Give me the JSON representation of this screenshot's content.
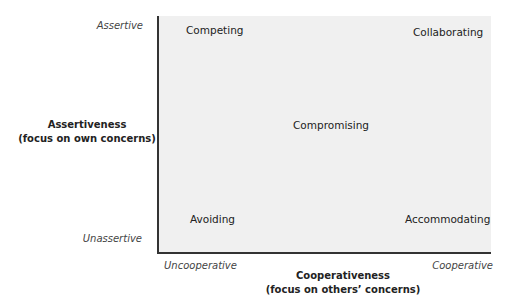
{
  "diagram": {
    "type": "conflict-modes-grid",
    "y_axis": {
      "title_line1": "Assertiveness",
      "title_line2": "(focus on own concerns)",
      "high_label": "Assertive",
      "low_label": "Unassertive"
    },
    "x_axis": {
      "title_line1": "Cooperativeness",
      "title_line2": "(focus on others’ concerns)",
      "low_label": "Uncooperative",
      "high_label": "Cooperative"
    },
    "modes": [
      {
        "label": "Competing",
        "position": "top-left"
      },
      {
        "label": "Collaborating",
        "position": "top-right"
      },
      {
        "label": "Compromising",
        "position": "center"
      },
      {
        "label": "Avoiding",
        "position": "bottom-left"
      },
      {
        "label": "Accommodating",
        "position": "bottom-right"
      }
    ],
    "colors": {
      "plot_background": "#f0f0f0",
      "axis_line": "#333333",
      "text": "#222222"
    }
  }
}
